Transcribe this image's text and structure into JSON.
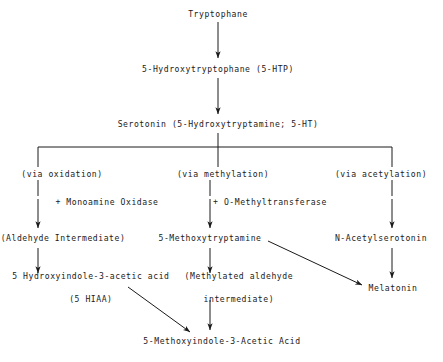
{
  "diagram": {
    "background_color": "#ffffff",
    "ink_color": "#1a1a1a",
    "nodes": {
      "tryptophane": "Tryptophane",
      "htp": "5-Hydroxytryptophane (5-HTP)",
      "serotonin": "Serotonin (5-Hydroxytryptamine; 5-HT)",
      "via_oxidation": "(via oxidation)",
      "via_methylation": "(via methylation)",
      "via_acetylation": "(via acetylation)",
      "monoamine_oxidase": "+ Monoamine Oxidase",
      "o_methyltransferase": "+ O-Methyltransferase",
      "aldehyde_intermediate": "(Aldehyde Intermediate)",
      "methoxytryptamine": "5-Methoxytryptamine",
      "n_acetylserotonin": "N-Acetylserotonin",
      "hiaa_line1": "5 Hydroxyindole-3-acetic acid",
      "hiaa_line2": "(5 HIAA)",
      "methylated_line1": "(Methylated aldehyde",
      "methylated_line2": "intermediate)",
      "melatonin": "Melatonin",
      "methoxyindole_acetic_acid": "5-Methoxyindole-3-Acetic Acid"
    }
  }
}
